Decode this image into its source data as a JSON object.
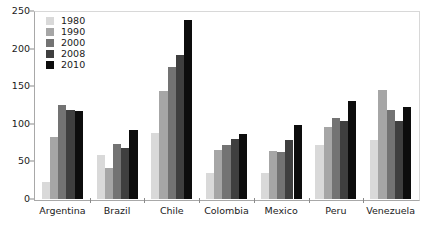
{
  "chart_data": {
    "type": "bar",
    "title": "",
    "xlabel": "",
    "ylabel": "",
    "ylim": [
      0,
      250
    ],
    "yticks": [
      0,
      50,
      100,
      150,
      200,
      250
    ],
    "grid": false,
    "legend_position": "top-left",
    "categories": [
      "Argentina",
      "Brazil",
      "Chile",
      "Colombia",
      "Mexico",
      "Peru",
      "Venezuela"
    ],
    "series": [
      {
        "name": "1980",
        "color": "#d9d9d9",
        "values": [
          23,
          59,
          88,
          34,
          34,
          72,
          78
        ]
      },
      {
        "name": "1990",
        "color": "#a6a6a6",
        "values": [
          83,
          41,
          143,
          65,
          64,
          96,
          145
        ]
      },
      {
        "name": "2000",
        "color": "#737373",
        "values": [
          125,
          73,
          176,
          72,
          62,
          108,
          118
        ]
      },
      {
        "name": "2008",
        "color": "#3f3f3f",
        "values": [
          118,
          68,
          192,
          80,
          78,
          104,
          104
        ]
      },
      {
        "name": "2010",
        "color": "#0d0d0d",
        "values": [
          117,
          92,
          238,
          86,
          98,
          131,
          122
        ]
      }
    ]
  },
  "axes": {
    "y_tick_labels": [
      "0",
      "50",
      "100",
      "150",
      "200",
      "250"
    ]
  },
  "legend": {
    "entries": [
      {
        "label": "1980"
      },
      {
        "label": "1990"
      },
      {
        "label": "2000"
      },
      {
        "label": "2008"
      },
      {
        "label": "2010"
      }
    ]
  },
  "colors": {
    "axis": "#8a8a8a",
    "text": "#1a1a1a",
    "background": "#ffffff"
  }
}
